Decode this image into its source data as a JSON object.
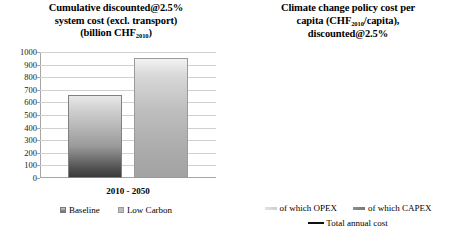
{
  "chart_data": [
    {
      "type": "bar",
      "id": "left",
      "title_lines": [
        "Cumulative discounted@2.5%",
        "system cost (excl. transport)",
        "(billion CHF",
        "2010",
        ")"
      ],
      "title_l1": "Cumulative discounted@2.5%",
      "title_l2": "system cost (excl. transport)",
      "title_l3_a": "(billion CHF",
      "title_l3_sub": "2010",
      "title_l3_b": ")",
      "categories": [
        "2010 - 2050"
      ],
      "category_label": "2010 - 2050",
      "series": [
        {
          "name": "Baseline",
          "values": [
            660
          ]
        },
        {
          "name": "Low Carbon",
          "values": [
            950
          ]
        }
      ],
      "legend": [
        "Baseline",
        "Low Carbon"
      ],
      "legend_position": "bottom",
      "ylabel": "",
      "xlabel": "",
      "ylim": [
        0,
        1000
      ],
      "yticks": [
        0,
        100,
        200,
        300,
        400,
        500,
        600,
        700,
        800,
        900,
        1000
      ],
      "ytick_labels": [
        "0",
        "100",
        "200",
        "300",
        "400",
        "500",
        "600",
        "700",
        "800",
        "900",
        "1000"
      ],
      "grid": true
    },
    {
      "type": "bar",
      "id": "right",
      "title_l1": "Climate change policy cost per",
      "title_l2_a": "capita (CHF",
      "title_l2_sub": "2010",
      "title_l2_b": "/capita),",
      "title_l3": "discounted@2.5%",
      "categories": [
        "2020",
        "2030",
        "2040",
        "2050"
      ],
      "series": [
        {
          "name": "of which OPEX",
          "values": [
            0,
            200,
            420,
            670
          ]
        },
        {
          "name": "of which CAPEX",
          "values": [
            0,
            80,
            680,
            1130
          ]
        },
        {
          "name": "Total annual cost",
          "type": "line",
          "values": [
            0,
            280,
            1100,
            1800
          ]
        }
      ],
      "legend": [
        "of which OPEX",
        "of which CAPEX",
        "Total annual cost"
      ],
      "legend_position": "bottom",
      "stacked": true,
      "ylabel": "",
      "xlabel": "",
      "ylim": [
        0,
        2000
      ],
      "yticks": [
        0,
        500,
        1000,
        1500,
        2000
      ],
      "ytick_labels": [
        "0",
        "500",
        "1000",
        "1500",
        "2000"
      ],
      "xtick_labels": [
        "2020",
        "2030",
        "2040",
        "2050"
      ],
      "grid": true
    }
  ],
  "colors": {
    "grid": "#d0d0d0",
    "axis": "#a6a6a6",
    "line": "#111111",
    "capex": "#8d8d8d",
    "opex": "#dcdcdc",
    "baseline": "#6a6a6a",
    "lowcarbon": "#bdbdbd",
    "background": "#ffffff"
  }
}
